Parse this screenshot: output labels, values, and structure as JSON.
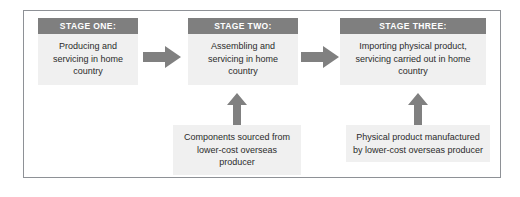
{
  "diagram": {
    "colors": {
      "header_band": "#7f7f7f",
      "box_fill": "#f0f0f0",
      "arrow": "#808080",
      "frame_border": "#8e9196",
      "body_text": "#2b2b2b",
      "header_text": "#ffffff"
    },
    "stages": [
      {
        "id": "stage-one",
        "header": "STAGE ONE:",
        "body": "Producing and servicing in home country"
      },
      {
        "id": "stage-two",
        "header": "STAGE TWO:",
        "body": "Assembling and servicing in home country"
      },
      {
        "id": "stage-three",
        "header": "STAGE THREE:",
        "body": "Importing physical product, servicing carried out in home country"
      }
    ],
    "supports": [
      {
        "id": "support-stage-two",
        "body": "Components sourced from lower-cost overseas producer"
      },
      {
        "id": "support-stage-three",
        "body": "Physical product manufactured by lower-cost overseas producer"
      }
    ],
    "arrows": [
      {
        "id": "arrow-stage-one-to-two",
        "icon": "arrow-right-icon"
      },
      {
        "id": "arrow-stage-two-to-three",
        "icon": "arrow-right-icon"
      },
      {
        "id": "arrow-support-to-stage-two",
        "icon": "arrow-up-icon"
      },
      {
        "id": "arrow-support-to-stage-three",
        "icon": "arrow-up-icon"
      }
    ]
  }
}
